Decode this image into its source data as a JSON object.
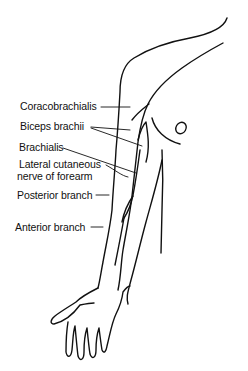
{
  "figure": {
    "line_color": "#111111",
    "background": "#ffffff"
  },
  "labels": [
    {
      "id": "coracobrachialis",
      "text": "Coracobrachialis"
    },
    {
      "id": "biceps",
      "text": "Biceps brachii"
    },
    {
      "id": "brachialis",
      "text": "Brachialis"
    },
    {
      "id": "lateral1",
      "text": "Lateral cutaneous"
    },
    {
      "id": "lateral2",
      "text": "nerve of forearm"
    },
    {
      "id": "posterior",
      "text": "Posterior branch"
    },
    {
      "id": "anterior",
      "text": "Anterior branch"
    }
  ]
}
